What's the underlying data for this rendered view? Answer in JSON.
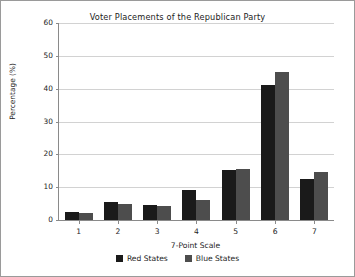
{
  "chart_data": {
    "type": "bar",
    "title": "Voter Placements of the Republican Party",
    "xlabel": "7-Point Scale",
    "ylabel": "Percentage (%)",
    "categories": [
      "1",
      "2",
      "3",
      "4",
      "5",
      "6",
      "7"
    ],
    "series": [
      {
        "name": "Red States",
        "color": "#1a1a1a",
        "values": [
          2.5,
          5.5,
          4.7,
          9.2,
          15.2,
          41.0,
          12.5
        ]
      },
      {
        "name": "Blue States",
        "color": "#4d4d4d",
        "values": [
          2.0,
          5.0,
          4.3,
          6.1,
          15.5,
          45.2,
          14.5
        ]
      }
    ],
    "ylim": [
      0,
      60
    ],
    "yticks": [
      0,
      10,
      20,
      30,
      40,
      50,
      60
    ],
    "grid": true,
    "legend_position": "bottom"
  },
  "figure": {
    "background": "#ffffff",
    "border_color": "#9a9a9a",
    "gridline_color": "#d2d2d2",
    "axis_color": "#8a8a8a"
  }
}
